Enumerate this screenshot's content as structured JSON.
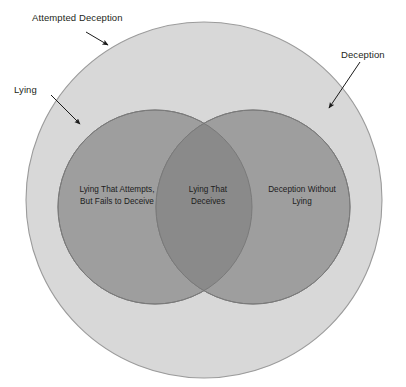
{
  "diagram": {
    "type": "venn",
    "title_visible": false,
    "background_color": "#ffffff",
    "colors": {
      "outer_fill": "#d8d8d8",
      "outer_stroke": "#9b9b9b",
      "circle_fill": "#9e9e9e",
      "circle_stroke": "#7a7a7a",
      "intersection_fill": "#8a8a8a",
      "label_text": "#231f20",
      "arrow": "#1a1a1a"
    },
    "sets": {
      "outer": {
        "name": "attempted-deception",
        "label": "Attempted Deception",
        "cx": 204,
        "cy": 200,
        "r": 178
      },
      "left": {
        "name": "lying",
        "label": "Lying",
        "cx": 155,
        "cy": 207,
        "r": 97
      },
      "right": {
        "name": "deception",
        "label": "Deception",
        "cx": 253,
        "cy": 207,
        "r": 97
      }
    },
    "callouts": [
      {
        "id": "attempted-deception",
        "label": "Attempted Deception",
        "arrow_from": [
          86,
          32
        ],
        "arrow_to": [
          110,
          46
        ]
      },
      {
        "id": "lying",
        "label": "Lying",
        "arrow_from": [
          51,
          95
        ],
        "arrow_to": [
          83,
          127
        ]
      },
      {
        "id": "deception",
        "label": "Deception",
        "arrow_from": [
          360,
          62
        ],
        "arrow_to": [
          326,
          111
        ]
      }
    ],
    "regions": [
      {
        "id": "lying-that-fails",
        "lines": [
          "Lying That Attempts,",
          "But Fails to Deceive"
        ],
        "line1": "Lying That Attempts,",
        "line2": "But Fails to Deceive"
      },
      {
        "id": "lying-that-deceives",
        "lines": [
          "Lying That",
          "Deceives"
        ],
        "line1": "Lying That",
        "line2": "Deceives"
      },
      {
        "id": "deception-without-lying",
        "lines": [
          "Deception Without",
          "Lying"
        ],
        "line1": "Deception Without",
        "line2": "Lying"
      }
    ]
  }
}
